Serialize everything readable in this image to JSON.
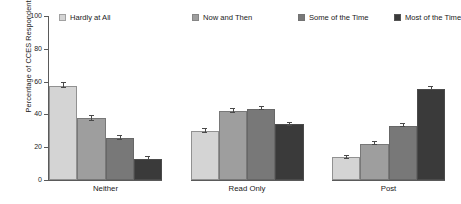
{
  "chart_data": {
    "type": "bar",
    "title": "",
    "xlabel": "",
    "ylabel": "Percentage of CCES Respondents",
    "ylim": [
      0,
      100
    ],
    "yticks": [
      0,
      20,
      40,
      60,
      80,
      100
    ],
    "ytick_labels": [
      "0",
      "20",
      "40",
      "60",
      "80",
      "100"
    ],
    "grid": false,
    "legend_position": "top",
    "categories": [
      "Neither",
      "Read Only",
      "Post"
    ],
    "series": [
      {
        "name": "Hardly at All",
        "color": "#d4d4d4",
        "values": [
          57.6,
          29.8,
          14.0
        ],
        "errors": [
          1.6,
          1.1,
          0.9
        ]
      },
      {
        "name": "Now and Then",
        "color": "#9e9e9e",
        "values": [
          37.6,
          42.0,
          22.2
        ],
        "errors": [
          1.4,
          1.1,
          1.0
        ]
      },
      {
        "name": "Some of the Time",
        "color": "#787878",
        "values": [
          25.6,
          43.5,
          33.1
        ],
        "errors": [
          1.2,
          1.0,
          1.0
        ]
      },
      {
        "name": "Most of the Time",
        "color": "#3a3a3a",
        "values": [
          13.0,
          34.1,
          55.7
        ],
        "errors": [
          1.0,
          0.9,
          1.0
        ]
      }
    ]
  },
  "axis": {
    "line_color": "#5a5a5a",
    "text_color": "#1a1a1a"
  }
}
